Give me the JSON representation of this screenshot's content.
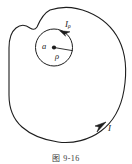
{
  "figure": {
    "caption": "图 9-16",
    "stroke_color": "#1d1d1d",
    "background_color": "#ffffff",
    "outer_loop": {
      "name": "irregular-closed-current-loop",
      "label": "I",
      "direction_arrow": "clockwise-at-lower-right"
    },
    "inner_circle": {
      "name": "small-circular-loop",
      "label": "I",
      "label_subscript": "ρ",
      "center_point_label": "a",
      "radius_label": "ρ",
      "direction_arrow": "clockwise-at-upper-right"
    }
  },
  "labels": {
    "inner_current_main": "I",
    "inner_current_sub": "ρ",
    "center_point": "a",
    "radius": "ρ",
    "outer_current": "I"
  }
}
